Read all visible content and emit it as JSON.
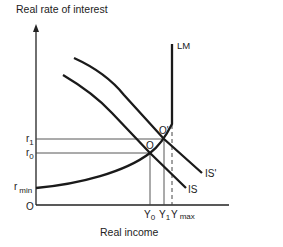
{
  "axes": {
    "y_label": "Real rate of interest",
    "x_label": "Real income",
    "origin_label": "O"
  },
  "y_ticks": {
    "r1": {
      "base": "r",
      "sub": "1"
    },
    "r0": {
      "base": "r",
      "sub": "0"
    },
    "rmin": {
      "base": "r",
      "sub": "min"
    }
  },
  "x_ticks": {
    "Y0": {
      "base": "Y",
      "sub": "0"
    },
    "Y1": {
      "base": "Y",
      "sub": "1"
    },
    "Ymax": {
      "base": "Y",
      "sub": "max"
    }
  },
  "curves": {
    "LM": "LM",
    "IS": "IS",
    "IS_prime": "IS'"
  },
  "points": {
    "O": "O",
    "O_prime": "O'"
  },
  "colors": {
    "curve": "#1a1a1a",
    "guide": "#444444"
  }
}
